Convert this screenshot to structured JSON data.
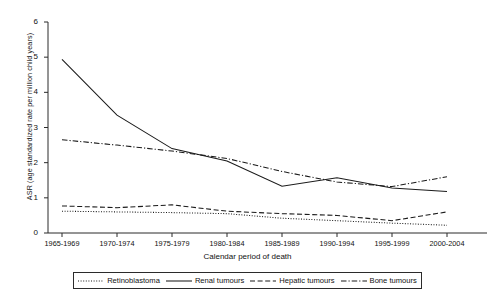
{
  "chart_data": {
    "type": "line",
    "title": "",
    "xlabel": "Calendar period of death",
    "ylabel": "ASR (age standardized rate per million child years)",
    "categories": [
      "1965-1969",
      "1970-1974",
      "1975-1979",
      "1980-1984",
      "1985-1989",
      "1990-1994",
      "1995-1999",
      "2000-2004"
    ],
    "ylim": [
      0,
      6
    ],
    "yticks": [
      "0",
      "1",
      "2",
      "3",
      "4",
      "5",
      "6"
    ],
    "grid": false,
    "legend_position": "bottom",
    "series": [
      {
        "name": "Retinoblastoma",
        "style": "dotted",
        "color": "#1a1a1a",
        "values": [
          0.62,
          0.6,
          0.58,
          0.55,
          0.42,
          0.35,
          0.28,
          0.22
        ]
      },
      {
        "name": "Renal tumours",
        "style": "solid",
        "color": "#1a1a1a",
        "values": [
          4.94,
          3.35,
          2.4,
          2.05,
          1.33,
          1.57,
          1.28,
          1.18
        ]
      },
      {
        "name": "Hepatic tumours",
        "style": "dashed",
        "color": "#1a1a1a",
        "values": [
          0.77,
          0.72,
          0.8,
          0.62,
          0.55,
          0.5,
          0.35,
          0.6
        ]
      },
      {
        "name": "Bone tumours",
        "style": "dashdot",
        "color": "#1a1a1a",
        "values": [
          2.65,
          2.5,
          2.33,
          2.12,
          1.75,
          1.45,
          1.32,
          1.6
        ]
      }
    ]
  },
  "legend": {
    "items": [
      {
        "label": "Retinoblastoma"
      },
      {
        "label": "Renal tumours"
      },
      {
        "label": "Hepatic tumours"
      },
      {
        "label": "Bone tumours"
      }
    ]
  }
}
